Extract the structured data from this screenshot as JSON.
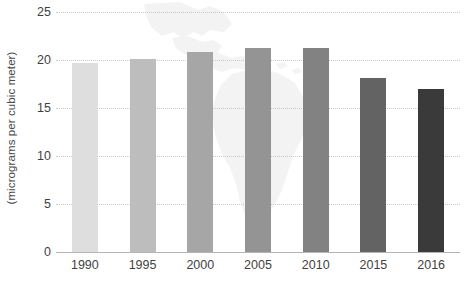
{
  "chart_data": {
    "type": "bar",
    "title": "",
    "subtitle": "",
    "xlabel": "",
    "ylabel": "(micrograms per cubic meter)",
    "categories": [
      "1990",
      "1995",
      "2000",
      "2005",
      "2010",
      "2015",
      "2016"
    ],
    "values": [
      19.7,
      20.1,
      20.8,
      21.2,
      21.2,
      18.1,
      17.0
    ],
    "ylim": [
      0,
      25
    ],
    "yticks": [
      0,
      5,
      10,
      15,
      20,
      25
    ],
    "ytick_labels": [
      "0",
      "5",
      "10",
      "15",
      "20",
      "25"
    ],
    "grid": "horizontal-dotted",
    "legend": "none",
    "bar_colors": [
      "#dedede",
      "#bdbdbd",
      "#a6a6a6",
      "#949494",
      "#828282",
      "#636363",
      "#3a3a3a"
    ],
    "background_watermark": "latin-america-map",
    "annotations": []
  },
  "axis": {
    "y_title": "(micrograms per cubic meter)"
  },
  "edge": {
    "clipped_label": "llll"
  },
  "colors": {
    "gridline": "#c9c9c9",
    "baseline": "#b4b4b4",
    "text": "#3f3f3f",
    "watermark": "#e8e8e8"
  }
}
